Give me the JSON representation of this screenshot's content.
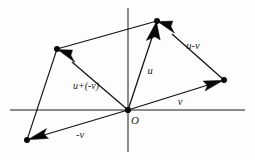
{
  "figure": {
    "background_color": "#fdfdfd",
    "ink_color": "#101010",
    "width": 255,
    "height": 160
  },
  "axes": {
    "x_axis": {
      "name": "horizontal-axis",
      "x1": 10,
      "y1": 110,
      "x2": 245,
      "y2": 110
    },
    "y_axis": {
      "name": "vertical-axis",
      "x1": 128,
      "y1": 8,
      "x2": 128,
      "y2": 152
    }
  },
  "points": {
    "origin": {
      "label": "O",
      "x": 128,
      "y": 110
    },
    "u_tip": {
      "label": "",
      "x": 157,
      "y": 21
    },
    "v_tip": {
      "label": "",
      "x": 224,
      "y": 80
    },
    "neg_v_tip": {
      "label": "",
      "x": 27,
      "y": 140
    },
    "u_minus_v_tip": {
      "label": "",
      "x": 57,
      "y": 49
    }
  },
  "vectors": [
    {
      "id": "u",
      "label": "u",
      "label_x": 150,
      "label_y": 72,
      "from": "origin",
      "to": "u_tip",
      "x1": 128,
      "y1": 110,
      "x2": 157,
      "y2": 21,
      "arrow_at": "tip"
    },
    {
      "id": "v",
      "label": "v",
      "label_x": 180,
      "label_y": 103,
      "from": "origin",
      "to": "v_tip",
      "x1": 128,
      "y1": 110,
      "x2": 224,
      "y2": 80,
      "arrow_at": "tip"
    },
    {
      "id": "neg-v",
      "label": "-v",
      "label_x": 80,
      "label_y": 136,
      "from": "origin",
      "to": "neg_v_tip",
      "x1": 128,
      "y1": 110,
      "x2": 27,
      "y2": 140,
      "arrow_at": "tip"
    },
    {
      "id": "u-minus-v",
      "label": "u-v",
      "label_x": 193,
      "label_y": 47,
      "from": "v_tip",
      "to": "u_tip",
      "x1": 224,
      "y1": 80,
      "x2": 157,
      "y2": 21,
      "arrow_at": "tip"
    },
    {
      "id": "u-plus-neg-v",
      "label": "u+(-v)",
      "label_x": 86,
      "label_y": 87,
      "from": "origin",
      "to": "u_minus_v_tip",
      "x1": 128,
      "y1": 110,
      "x2": 57,
      "y2": 49,
      "arrow_at": "tip"
    }
  ],
  "construction_edges": [
    {
      "id": "edge-top",
      "desc": "u-tip to resultant tip",
      "x1": 157,
      "y1": 21,
      "x2": 57,
      "y2": 49
    },
    {
      "id": "edge-left",
      "desc": "neg-v tip to resultant tip",
      "x1": 27,
      "y1": 140,
      "x2": 57,
      "y2": 49
    }
  ],
  "labels": {
    "origin": "O",
    "u": "u",
    "v": "v",
    "neg_v": "-v",
    "u_minus_v": "u-v",
    "u_plus_neg_v": "u+(-v)"
  },
  "label_positions": {
    "origin": {
      "x": 135,
      "y": 121
    },
    "u": {
      "x": 150,
      "y": 72
    },
    "v": {
      "x": 180,
      "y": 103
    },
    "neg_v": {
      "x": 80,
      "y": 136
    },
    "u_minus_v": {
      "x": 193,
      "y": 47
    },
    "u_plus_neg_v": {
      "x": 86,
      "y": 87
    }
  }
}
